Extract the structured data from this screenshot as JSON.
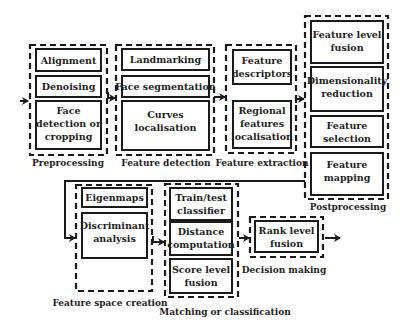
{
  "diagram": {
    "groups": [
      {
        "id": "preprocessing",
        "label": "Preprocessing",
        "steps": [
          {
            "lines": [
              "Alignment"
            ]
          },
          {
            "lines": [
              "Denoising"
            ]
          },
          {
            "lines": [
              "Face",
              "detection or",
              "cropping"
            ]
          }
        ]
      },
      {
        "id": "feature-detection",
        "label": "Feature detection",
        "steps": [
          {
            "lines": [
              "Landmarking"
            ]
          },
          {
            "lines": [
              "Face segmentation"
            ]
          },
          {
            "lines": [
              "Curves",
              "localisation"
            ]
          }
        ]
      },
      {
        "id": "feature-extraction",
        "label": "Feature extraction",
        "steps": [
          {
            "lines": [
              "Feature",
              "descriptors"
            ]
          },
          {
            "lines": [
              "Regional",
              "features",
              "localisation"
            ]
          }
        ]
      },
      {
        "id": "postprocessing",
        "label": "Postprocessing",
        "steps": [
          {
            "lines": [
              "Feature level",
              "fusion"
            ]
          },
          {
            "lines": [
              "Dimensionality",
              "reduction"
            ]
          },
          {
            "lines": [
              "Feature",
              "selection"
            ]
          },
          {
            "lines": [
              "Feature",
              "mapping"
            ]
          }
        ]
      },
      {
        "id": "feature-space-creation",
        "label": "Feature space creation",
        "steps": [
          {
            "lines": [
              "Eigenmaps"
            ]
          },
          {
            "lines": [
              "Discriminant",
              "analysis"
            ]
          }
        ]
      },
      {
        "id": "matching-or-classification",
        "label": "Matching or classification",
        "steps": [
          {
            "lines": [
              "Train/test",
              "classifier"
            ]
          },
          {
            "lines": [
              "Distance",
              "computation"
            ]
          },
          {
            "lines": [
              "Score level",
              "fusion"
            ]
          }
        ]
      },
      {
        "id": "decision-making",
        "label": "Decision making",
        "steps": [
          {
            "lines": [
              "Rank level",
              "fusion"
            ]
          }
        ]
      }
    ],
    "flow": [
      "input",
      "preprocessing",
      "feature-detection",
      "feature-extraction",
      "postprocessing",
      "feature-space-creation",
      "matching-or-classification",
      "decision-making",
      "output"
    ]
  }
}
